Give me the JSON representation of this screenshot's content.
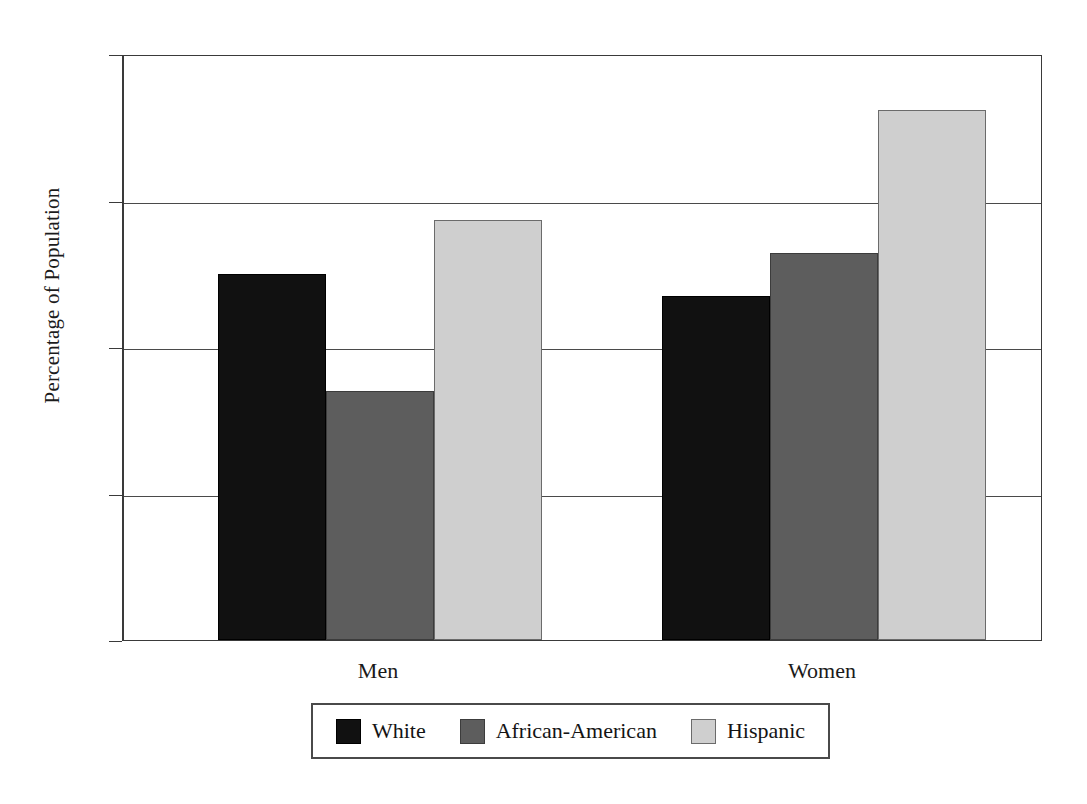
{
  "chart_data": {
    "type": "bar",
    "title": "",
    "subtitle": "",
    "xlabel": "",
    "ylabel": "Percentage of Population",
    "ylim": [
      0,
      40
    ],
    "ytick_labels": [
      "40",
      "30",
      "20",
      "10",
      "0"
    ],
    "ytick_values": [
      40,
      30,
      20,
      10,
      0
    ],
    "grid": true,
    "grid_axis": "y",
    "legend_position": "bottom-center",
    "categories": [
      "Men",
      "Women"
    ],
    "series": [
      {
        "name": "White",
        "color": "#111111",
        "values": [
          25.0,
          23.5
        ]
      },
      {
        "name": "African-American",
        "color": "#5d5d5d",
        "values": [
          17.0,
          26.4
        ]
      },
      {
        "name": "Hispanic",
        "color": "#cfcfcf",
        "values": [
          28.7,
          36.2
        ]
      }
    ]
  },
  "axis": {
    "y_title": "Percentage of Population",
    "ticks": [
      {
        "label": "40",
        "value": 40
      },
      {
        "label": "30",
        "value": 30
      },
      {
        "label": "20",
        "value": 20
      },
      {
        "label": "10",
        "value": 10
      },
      {
        "label": "0",
        "value": 0
      }
    ]
  },
  "groups": [
    {
      "label": "Men"
    },
    {
      "label": "Women"
    }
  ],
  "legend": {
    "entries": [
      {
        "label": "White",
        "swatch": "swatch-white"
      },
      {
        "label": "African-American",
        "swatch": "swatch-african"
      },
      {
        "label": "Hispanic",
        "swatch": "swatch-hisp"
      }
    ]
  },
  "colors": {
    "white": "#111111",
    "african_american": "#5d5d5d",
    "hispanic": "#cfcfcf",
    "axis": "#3a3a3a",
    "background": "#ffffff"
  }
}
